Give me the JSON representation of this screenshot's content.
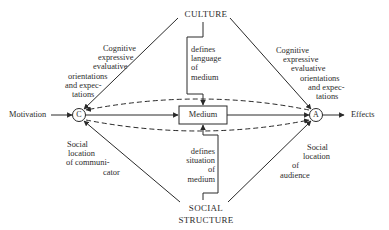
{
  "diagram": {
    "nodes": {
      "culture": {
        "label": "CULTURE"
      },
      "social_structure": {
        "line1": "SOCIAL",
        "line2": "STRUCTURE"
      },
      "communicator": {
        "letter": "C"
      },
      "audience": {
        "letter": "A"
      },
      "medium": {
        "label": "Medium"
      },
      "motivation": {
        "label": "Motivation"
      },
      "effects": {
        "label": "Effects"
      }
    },
    "edge_labels": {
      "culture_to_communicator": [
        "Cognitive",
        "expressive",
        "evaluative",
        "orientations",
        "and expec-",
        "tations"
      ],
      "culture_to_audience": [
        "Cognitive",
        "expressive",
        "evaluative",
        "orientations",
        "and expec-",
        "tations"
      ],
      "culture_to_medium": [
        "defines",
        "language",
        "of",
        "medium"
      ],
      "social_to_medium": [
        "defines",
        "situation",
        "of",
        "medium"
      ],
      "social_to_communicator": [
        "Social",
        "location",
        "of communi-",
        "cator"
      ],
      "social_to_audience": [
        "Social",
        "location",
        "of",
        "audience"
      ]
    },
    "colors": {
      "line": "#2a2a2a",
      "background": "#ffffff"
    }
  }
}
